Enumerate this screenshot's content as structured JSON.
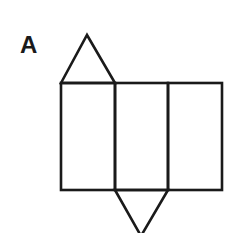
{
  "figure": {
    "label": "A",
    "stroke_color": "#1a1a1a",
    "background": "#ffffff",
    "shapes": {
      "top_triangle": {
        "points": "61,83 87,35 115,83"
      },
      "rectangles": [
        {
          "x": 61,
          "y": 83,
          "width": 54,
          "height": 107
        },
        {
          "x": 115,
          "y": 83,
          "width": 53,
          "height": 107
        },
        {
          "x": 168,
          "y": 83,
          "width": 54,
          "height": 107
        }
      ],
      "bottom_triangle": {
        "points": "115,190 141,236 168,190"
      }
    }
  }
}
